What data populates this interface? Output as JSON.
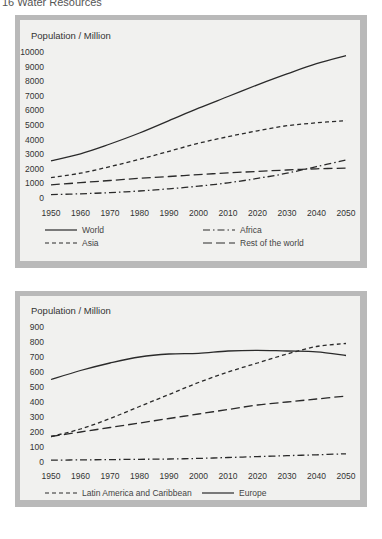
{
  "page": {
    "header": "16  Water Resources"
  },
  "chart_data": [
    {
      "type": "line",
      "title": "",
      "ylabel": "Population / Million",
      "xlabel": "",
      "ylim": [
        0,
        10000
      ],
      "yticks": [
        0,
        1000,
        2000,
        3000,
        4000,
        5000,
        6000,
        7000,
        8000,
        9000,
        10000
      ],
      "x": [
        1950,
        1960,
        1970,
        1980,
        1990,
        2000,
        2010,
        2020,
        2030,
        2040,
        2050
      ],
      "grid": false,
      "legend_position": "bottom",
      "series": [
        {
          "name": "World",
          "style": "solid",
          "values": [
            2550,
            3030,
            3700,
            4450,
            5300,
            6150,
            6950,
            7750,
            8500,
            9200,
            9750
          ]
        },
        {
          "name": "Asia",
          "style": "dashed",
          "values": [
            1400,
            1700,
            2150,
            2650,
            3200,
            3750,
            4200,
            4600,
            4950,
            5150,
            5300
          ]
        },
        {
          "name": "Africa",
          "style": "dash-dot",
          "values": [
            230,
            290,
            370,
            480,
            630,
            810,
            1040,
            1340,
            1700,
            2150,
            2600
          ]
        },
        {
          "name": "Rest of the world",
          "style": "long-dash",
          "values": [
            900,
            1050,
            1200,
            1350,
            1470,
            1600,
            1720,
            1820,
            1920,
            2000,
            2050
          ]
        }
      ],
      "legend": [
        {
          "label": "World",
          "style": "solid"
        },
        {
          "label": "Africa",
          "style": "dash-dot"
        },
        {
          "label": "Asia",
          "style": "dashed"
        },
        {
          "label": "Rest of the world",
          "style": "long-dash"
        }
      ]
    },
    {
      "type": "line",
      "title": "",
      "ylabel": "Population / Million",
      "xlabel": "",
      "ylim": [
        0,
        900
      ],
      "yticks": [
        0,
        100,
        200,
        300,
        400,
        500,
        600,
        700,
        800,
        900
      ],
      "x": [
        1950,
        1960,
        1970,
        1980,
        1990,
        2000,
        2010,
        2020,
        2030,
        2040,
        2050
      ],
      "grid": false,
      "legend_position": "bottom",
      "series": [
        {
          "name": "Latin America and Caribbean",
          "style": "dashed",
          "values": [
            170,
            220,
            290,
            370,
            450,
            530,
            600,
            660,
            720,
            770,
            790
          ]
        },
        {
          "name": "Europe",
          "style": "solid",
          "values": [
            550,
            610,
            660,
            700,
            720,
            725,
            740,
            745,
            740,
            735,
            710
          ]
        },
        {
          "name": "North America",
          "style": "long-dash",
          "values": [
            170,
            200,
            230,
            260,
            290,
            320,
            350,
            380,
            400,
            420,
            440
          ]
        },
        {
          "name": "Oceania",
          "style": "dash-dot",
          "values": [
            12,
            14,
            16,
            18,
            20,
            24,
            30,
            36,
            42,
            48,
            55
          ]
        }
      ],
      "legend": [
        {
          "label": "Latin America and Caribbean",
          "style": "dashed"
        },
        {
          "label": "Europe",
          "style": "solid"
        },
        {
          "label": "North America",
          "style": "long-dash"
        },
        {
          "label": "Oceania",
          "style": "dash-dot"
        }
      ]
    }
  ]
}
